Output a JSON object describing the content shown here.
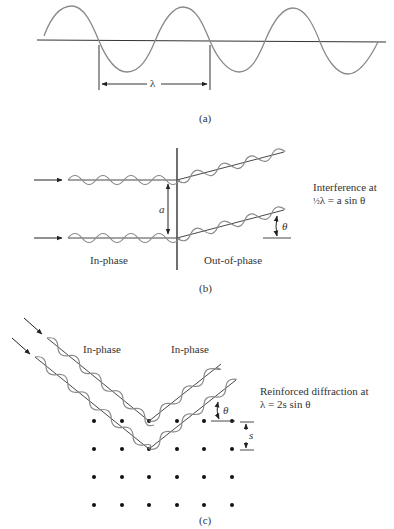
{
  "panels": {
    "a": {
      "caption": "(a)",
      "wavelength_label": "λ"
    },
    "b": {
      "caption": "(b)",
      "separation_label": "a",
      "angle_label": "θ",
      "left_region_label": "In-phase",
      "right_region_label": "Out-of-phase",
      "note_line1": "Interference at",
      "note_line2_frac": "½",
      "note_line2_rest": "λ = a sin θ"
    },
    "c": {
      "caption": "(c)",
      "incident_label": "In-phase",
      "reflected_label": "In-phase",
      "angle_label": "θ",
      "spacing_label": "s",
      "note_line1": "Reinforced diffraction at",
      "note_line2": "λ = 2s sin θ",
      "lattice": {
        "columns": [
          94,
          122,
          149,
          177,
          204,
          232
        ],
        "rows": [
          421,
          449,
          477,
          504
        ]
      }
    }
  },
  "colors": {
    "wave": "#8a8a8a",
    "line": "#222222",
    "dot": "#111111"
  }
}
